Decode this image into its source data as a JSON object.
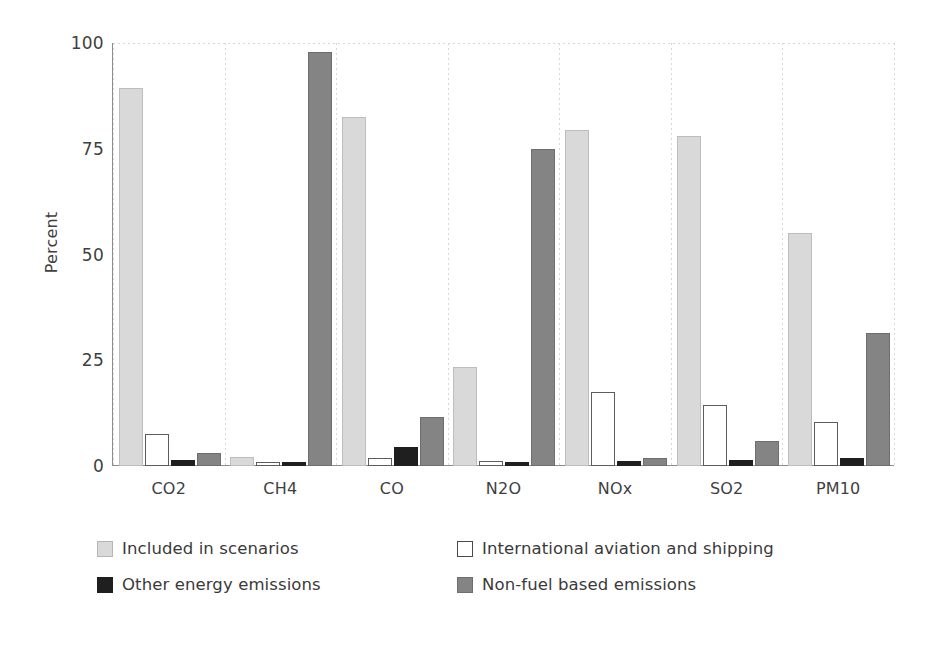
{
  "chart_data": {
    "type": "bar",
    "title": "",
    "xlabel": "",
    "ylabel": "Percent",
    "ylim": [
      0,
      100
    ],
    "yticks": [
      0,
      25,
      50,
      75,
      100
    ],
    "ytick_labels": [
      "0",
      "25",
      "50",
      "75",
      "100"
    ],
    "grid": "horizontal-top-and-vertical-category-separators",
    "legend_position": "bottom",
    "categories": [
      "CO2",
      "CH4",
      "CO",
      "N2O",
      "NOx",
      "SO2",
      "PM10"
    ],
    "series": [
      {
        "name": "Included in scenarios",
        "color": "#d9d9d9",
        "values": [
          89.0,
          1.6,
          82.0,
          23.0,
          79.0,
          77.5,
          54.5
        ]
      },
      {
        "name": "International aviation and shipping",
        "color": "#ffffff",
        "values": [
          7.0,
          0.2,
          1.5,
          0.8,
          17.0,
          14.0,
          10.0
        ]
      },
      {
        "name": "Other energy emissions",
        "color": "#1f1f1f",
        "values": [
          1.0,
          0.3,
          4.0,
          0.4,
          0.7,
          1.0,
          1.5
        ]
      },
      {
        "name": "Non-fuel based emissions",
        "color": "#848484",
        "values": [
          2.5,
          97.3,
          11.0,
          74.5,
          1.5,
          5.5,
          31.0
        ]
      }
    ]
  },
  "legend": {
    "items": [
      {
        "label": "Included in scenarios",
        "swatch": "s0"
      },
      {
        "label": "International aviation and shipping",
        "swatch": "s1"
      },
      {
        "label": "Other energy emissions",
        "swatch": "s2"
      },
      {
        "label": "Non-fuel based emissions",
        "swatch": "s3"
      }
    ]
  }
}
